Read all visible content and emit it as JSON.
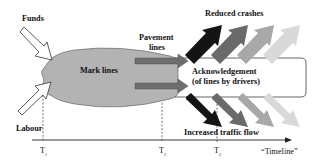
{
  "diagram": {
    "inputs": {
      "funds": "Funds",
      "labour": "Labour"
    },
    "core": {
      "mark_lines": "Mark lines",
      "pavement_lines_line1": "Pavement",
      "pavement_lines_line2": "lines",
      "acknowledgement_line1": "Acknowledgement",
      "acknowledgement_line2": "(of lines by drivers)"
    },
    "outcomes": {
      "reduced_crashes": "Reduced crashes",
      "increased_traffic_flow": "Increased traffic flow"
    },
    "timeline": {
      "label": "“Timeline”",
      "ticks": [
        {
          "label": "T",
          "sub": "1"
        },
        {
          "label": "T",
          "sub": "2"
        },
        {
          "label": "T",
          "sub": "3"
        }
      ]
    },
    "colors": {
      "ellipse_fill": "#b3b3b3",
      "pavement_arrow": "#6e6e6e",
      "outcome_arrow_shades": [
        "#141414",
        "#6a6a6a",
        "#a8a8a8",
        "#d6d6d6"
      ],
      "line": "#222222"
    }
  }
}
